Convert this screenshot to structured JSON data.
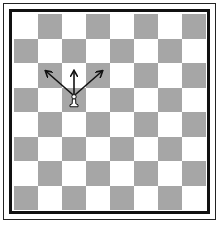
{
  "board": {
    "files": 8,
    "ranks": 8,
    "light_color": "#ffffff",
    "dark_color": "#a6a6a6",
    "top_left_square": "light"
  },
  "pieces": [
    {
      "type": "pawn",
      "color": "white",
      "col": 3,
      "row": 4,
      "glyph": "♙"
    }
  ],
  "arrows": [
    {
      "from": {
        "col": 3,
        "row": 4
      },
      "to": {
        "col": 2,
        "row": 3
      },
      "label": "capture-left"
    },
    {
      "from": {
        "col": 3,
        "row": 4
      },
      "to": {
        "col": 3,
        "row": 3
      },
      "label": "advance"
    },
    {
      "from": {
        "col": 3,
        "row": 4
      },
      "to": {
        "col": 4,
        "row": 3
      },
      "label": "capture-right"
    }
  ]
}
